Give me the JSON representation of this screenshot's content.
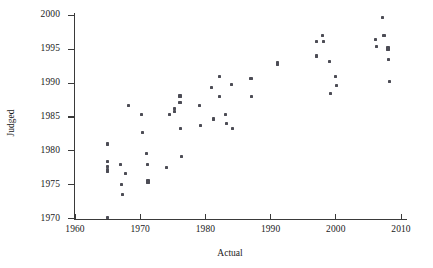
{
  "figure": {
    "background": "#ffffff",
    "marker_color": "#4c4c55",
    "axis_color": "#3a3a3a"
  },
  "axes": {
    "xlabel": "Actual",
    "ylabel": "Judged",
    "xticks": [
      1960,
      1970,
      1980,
      1990,
      2000,
      2010
    ],
    "yticks": [
      1970,
      1975,
      1980,
      1985,
      1990,
      1995,
      2000
    ],
    "xlim": [
      1958,
      2009.5
    ],
    "ylim": [
      1969,
      2000.5
    ],
    "grid": false,
    "legend": "none"
  },
  "chart_data": {
    "type": "scatter",
    "title": "",
    "xlabel": "Actual",
    "ylabel": "Judged",
    "xlim": [
      1958,
      2009.5
    ],
    "ylim": [
      1969,
      2000.5
    ],
    "xticks": [
      1960,
      1970,
      1980,
      1990,
      2000,
      2010
    ],
    "yticks": [
      1970,
      1975,
      1980,
      1985,
      1990,
      1995,
      2000
    ],
    "grid": false,
    "marker": "square",
    "marker_color": "#4c4c55",
    "series": [
      {
        "name": "events",
        "points": [
          [
            1965.0,
            1981.0
          ],
          [
            1965.0,
            1978.4
          ],
          [
            1965.0,
            1977.7
          ],
          [
            1965.0,
            1977.2
          ],
          [
            1965.0,
            1976.9
          ],
          [
            1965.0,
            1970.1
          ],
          [
            1967.0,
            1978.0
          ],
          [
            1967.2,
            1975.0
          ],
          [
            1967.3,
            1973.6
          ],
          [
            1967.7,
            1976.7
          ],
          [
            1968.2,
            1986.7
          ],
          [
            1970.2,
            1985.4
          ],
          [
            1970.3,
            1982.7
          ],
          [
            1971.0,
            1979.6
          ],
          [
            1971.1,
            1978.0
          ],
          [
            1971.2,
            1975.6
          ],
          [
            1971.2,
            1975.3
          ],
          [
            1974.0,
            1977.5
          ],
          [
            1974.5,
            1985.4
          ],
          [
            1975.2,
            1986.2
          ],
          [
            1975.2,
            1985.8
          ],
          [
            1976.1,
            1988.1
          ],
          [
            1976.1,
            1987.2
          ],
          [
            1976.2,
            1983.3
          ],
          [
            1976.3,
            1979.2
          ],
          [
            1979.1,
            1986.7
          ],
          [
            1979.2,
            1983.7
          ],
          [
            1981.0,
            1989.3
          ],
          [
            1981.2,
            1984.7
          ],
          [
            1982.1,
            1991.0
          ],
          [
            1982.2,
            1988.0
          ],
          [
            1983.1,
            1985.4
          ],
          [
            1983.2,
            1984.0
          ],
          [
            1984.0,
            1989.8
          ],
          [
            1984.1,
            1983.3
          ],
          [
            1987.0,
            1990.7
          ],
          [
            1987.1,
            1988.0
          ],
          [
            1991.0,
            1993.1
          ],
          [
            1991.0,
            1992.8
          ],
          [
            1997.0,
            1996.2
          ],
          [
            1997.1,
            1994.0
          ],
          [
            1998.0,
            1997.0
          ],
          [
            1998.1,
            1996.2
          ],
          [
            1999.0,
            1993.2
          ],
          [
            1999.2,
            1988.5
          ],
          [
            2000.0,
            1991.0
          ],
          [
            2000.1,
            1989.7
          ],
          [
            2006.1,
            1996.5
          ],
          [
            2006.2,
            1995.4
          ],
          [
            2007.2,
            1999.7
          ],
          [
            2007.4,
            1997.0
          ],
          [
            2008.0,
            1995.3
          ],
          [
            2008.0,
            1995.0
          ],
          [
            2008.1,
            1993.5
          ],
          [
            2008.2,
            1990.2
          ]
        ]
      }
    ]
  }
}
